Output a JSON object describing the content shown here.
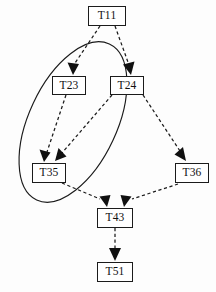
{
  "diagram": {
    "background_color": "#fdfdfd",
    "line_color": "#1c1c1c",
    "node_fill": "#ffffff",
    "nodes": [
      {
        "id": "T11",
        "label": "T11",
        "x": 88,
        "y": 6,
        "w": 38,
        "h": 20
      },
      {
        "id": "T23",
        "label": "T23",
        "x": 52,
        "y": 76,
        "w": 34,
        "h": 19
      },
      {
        "id": "T24",
        "label": "T24",
        "x": 110,
        "y": 76,
        "w": 34,
        "h": 19
      },
      {
        "id": "T35",
        "label": "T35",
        "x": 32,
        "y": 163,
        "w": 34,
        "h": 20
      },
      {
        "id": "T36",
        "label": "T36",
        "x": 175,
        "y": 163,
        "w": 34,
        "h": 20
      },
      {
        "id": "T43",
        "label": "T43",
        "x": 97,
        "y": 208,
        "w": 36,
        "h": 20
      },
      {
        "id": "T51",
        "label": "T51",
        "x": 97,
        "y": 262,
        "w": 36,
        "h": 20
      }
    ],
    "edges": [
      {
        "from": "T11",
        "to": "T23",
        "style": "dashed",
        "arrow": "solid-triangle"
      },
      {
        "from": "T11",
        "to": "T24",
        "style": "dashed",
        "arrow": "solid-triangle"
      },
      {
        "from": "T23",
        "to": "T35",
        "style": "dashed",
        "arrow": "solid-triangle"
      },
      {
        "from": "T24",
        "to": "T35",
        "style": "dashed",
        "arrow": "solid-triangle"
      },
      {
        "from": "T24",
        "to": "T36",
        "style": "dashed",
        "arrow": "solid-triangle"
      },
      {
        "from": "T35",
        "to": "T43",
        "style": "dashed",
        "arrow": "solid-triangle"
      },
      {
        "from": "T36",
        "to": "T43",
        "style": "dashed",
        "arrow": "solid-triangle"
      },
      {
        "from": "T43",
        "to": "T51",
        "style": "dashed",
        "arrow": "solid-triangle"
      }
    ],
    "groups": [
      {
        "id": "cluster-1",
        "shape": "ellipse",
        "style": "solid",
        "contains": [
          "T23",
          "T24",
          "T35"
        ],
        "cx": 73,
        "cy": 122,
        "rx": 44,
        "ry": 86,
        "rotation": 25
      }
    ]
  }
}
